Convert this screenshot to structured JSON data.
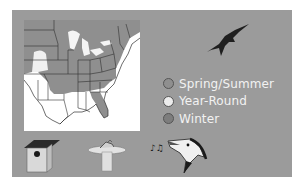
{
  "map": {
    "alt": "Range map of eastern United States",
    "colors": {
      "spring_summer": "#8f8f8f",
      "year_round": "#e6e6e6",
      "winter": "#7a7a7a",
      "background": "#ffffff"
    }
  },
  "legend": {
    "items": [
      {
        "label": "Spring/Summer",
        "color": "#8f8f8f"
      },
      {
        "label": "Year-Round",
        "color": "#ececec"
      },
      {
        "label": "Winter",
        "color": "#7d7d7d"
      }
    ]
  },
  "icons": {
    "flying_bird": "flying-bird-silhouette",
    "nest": "birdhouse",
    "feeder": "birdbath",
    "song": "singing-bird-head"
  },
  "colors": {
    "panel": "#9b9b9b",
    "page": "#ffffff",
    "legend_text": "#f2f2f2"
  }
}
